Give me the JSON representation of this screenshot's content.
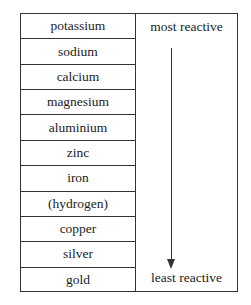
{
  "diagram": {
    "elements": [
      {
        "label": "potassium"
      },
      {
        "label": "sodium"
      },
      {
        "label": "calcium"
      },
      {
        "label": "magnesium"
      },
      {
        "label": "aluminium"
      },
      {
        "label": "zinc"
      },
      {
        "label": "iron"
      },
      {
        "label": "(hydrogen)"
      },
      {
        "label": "copper"
      },
      {
        "label": "silver"
      },
      {
        "label": "gold"
      }
    ],
    "top_label": "most reactive",
    "bottom_label": "least reactive",
    "arrow_direction": "down"
  }
}
